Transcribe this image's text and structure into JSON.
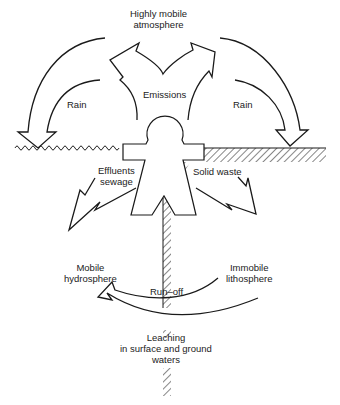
{
  "diagram": {
    "type": "cycle-flow",
    "labels": {
      "atmosphere_line1": "Highly mobile",
      "atmosphere_line2": "atmosphere",
      "emissions": "Emissions",
      "rain_left": "Rain",
      "rain_right": "Rain",
      "effluents_line1": "Effluents",
      "effluents_line2": "sewage",
      "solid_waste": "Solid waste",
      "hydrosphere_line1": "Mobile",
      "hydrosphere_line2": "hydrosphere",
      "lithosphere_line1": "Immobile",
      "lithosphere_line2": "lithosphere",
      "runoff": "Run–off",
      "leaching_line1": "Leaching",
      "leaching_line2": "in surface and ground",
      "leaching_line3": "waters"
    },
    "nodes": [
      "Human figure",
      "Highly mobile atmosphere",
      "Mobile hydrosphere (water surface)",
      "Immobile lithosphere (ground)"
    ],
    "edges": [
      {
        "from": "Human figure",
        "to": "Highly mobile atmosphere",
        "label": "Emissions"
      },
      {
        "from": "Highly mobile atmosphere",
        "to": "Mobile hydrosphere",
        "label": "Rain"
      },
      {
        "from": "Highly mobile atmosphere",
        "to": "Immobile lithosphere",
        "label": "Rain"
      },
      {
        "from": "Human figure",
        "to": "Mobile hydrosphere",
        "label": "Effluents sewage"
      },
      {
        "from": "Human figure",
        "to": "Immobile lithosphere",
        "label": "Solid waste"
      },
      {
        "from": "Immobile lithosphere",
        "to": "Mobile hydrosphere",
        "label": "Run-off"
      },
      {
        "from": "Immobile lithosphere",
        "to": "Mobile hydrosphere",
        "label": "Leaching in surface and ground waters"
      }
    ],
    "colors": {
      "line": "#1a1a1a",
      "background": "#ffffff"
    }
  }
}
